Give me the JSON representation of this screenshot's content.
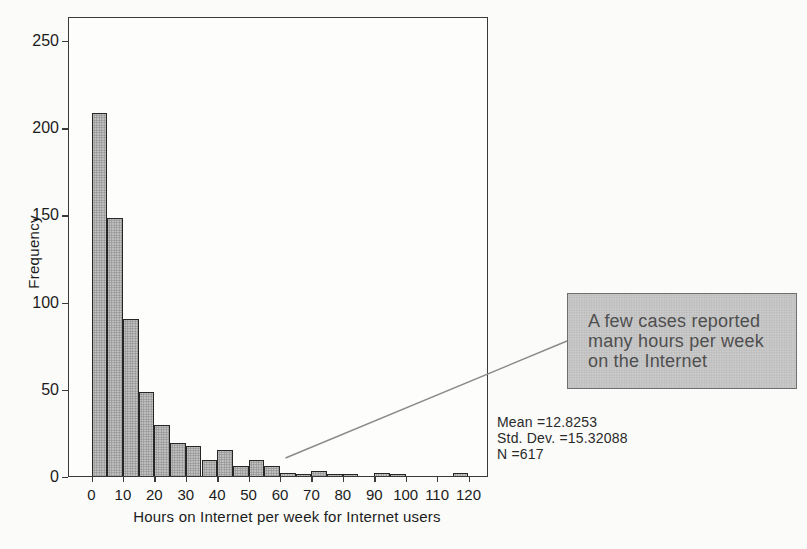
{
  "chart_data": {
    "type": "bar",
    "subtype": "histogram",
    "title": "",
    "xlabel": "Hours on Internet per week for Internet users",
    "ylabel": "Frequency",
    "bin_width": 5,
    "bin_starts": [
      0,
      5,
      10,
      15,
      20,
      25,
      30,
      35,
      40,
      45,
      50,
      55,
      60,
      65,
      70,
      75,
      80,
      85,
      90,
      95,
      100,
      105,
      110,
      115
    ],
    "frequencies": [
      208,
      148,
      90,
      48,
      29,
      19,
      17,
      9,
      15,
      6,
      9,
      6,
      2,
      1,
      3,
      1,
      1,
      0,
      2,
      1,
      0,
      0,
      0,
      2
    ],
    "x_ticks": [
      0,
      10,
      20,
      30,
      40,
      50,
      60,
      70,
      80,
      90,
      100,
      110,
      120
    ],
    "y_ticks": [
      0,
      50,
      100,
      150,
      200,
      250
    ],
    "xlim": [
      -7.5,
      126
    ],
    "ylim": [
      0,
      264
    ],
    "grid": false,
    "legend": null
  },
  "stats": {
    "lines": [
      "Mean =12.8253",
      "Std. Dev. =15.32088",
      "N =617"
    ]
  },
  "annotation": {
    "lines": [
      "A few cases reported",
      "many hours per week",
      "on the Internet"
    ]
  },
  "colors": {
    "background": "#fbfbf9",
    "frame": "#3a3a3a",
    "bar_fill": "#c6c6c6",
    "bar_dot": "#909090",
    "bar_border": "#262626",
    "tick": "#3a3a3a",
    "text": "#1c1c1c",
    "stats_text": "#2a2a2a",
    "callout_bg": "#cacaca",
    "callout_dot": "#b2b2b2",
    "callout_border": "#6f6f6f",
    "callout_text": "#4f4f4f",
    "leader": "#8a8a8a"
  }
}
